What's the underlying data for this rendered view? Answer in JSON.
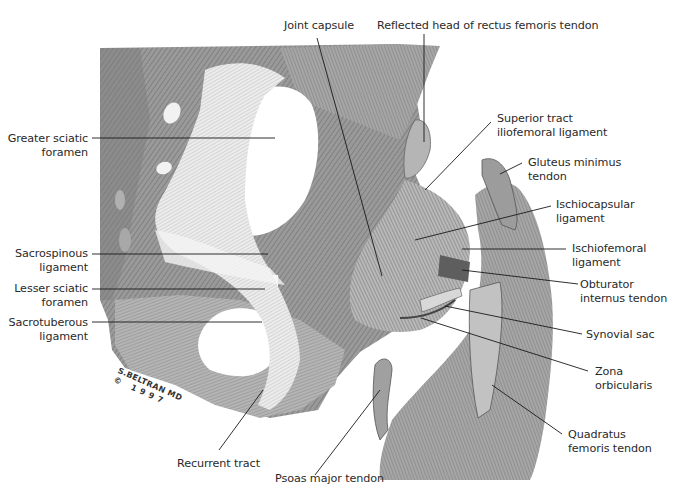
{
  "figure": {
    "signature": {
      "line1": "S.BELTRAN MD",
      "line2": "© 1997"
    }
  },
  "labels": {
    "joint_capsule": "Joint capsule",
    "reflected_head": "Reflected head of rectus femoris tendon",
    "greater_sciatic": {
      "line1": "Greater sciatic",
      "line2": "foramen"
    },
    "superior_tract": {
      "line1": "Superior tract",
      "line2": "iliofemoral ligament"
    },
    "gluteus_minimus": {
      "line1": "Gluteus minimus",
      "line2": "tendon"
    },
    "ischiocapsular": {
      "line1": "Ischiocapsular",
      "line2": "ligament"
    },
    "sacrospinous": {
      "line1": "Sacrospinous",
      "line2": "ligament"
    },
    "ischiofemoral": {
      "line1": "Ischiofemoral",
      "line2": "ligament"
    },
    "lesser_sciatic": {
      "line1": "Lesser sciatic",
      "line2": "foramen"
    },
    "obturator_internus": {
      "line1": "Obturator",
      "line2": "internus tendon"
    },
    "sacrotuberous": {
      "line1": "Sacrotuberous",
      "line2": "ligament"
    },
    "synovial_sac": "Synovial sac",
    "zona_orbicularis": {
      "line1": "Zona",
      "line2": "orbicularis"
    },
    "recurrent_tract": "Recurrent tract",
    "quadratus_femoris": {
      "line1": "Quadratus",
      "line2": "femoris tendon"
    },
    "psoas_major": "Psoas major tendon"
  },
  "colors": {
    "background": "#ffffff",
    "bone_dark": "#8a8a8a",
    "bone_mid": "#a8a8a8",
    "bone_light": "#c8c8c8",
    "ligament": "#e8e8e8",
    "leader_line": "#1a1a1a",
    "text": "#2a2a2a"
  }
}
